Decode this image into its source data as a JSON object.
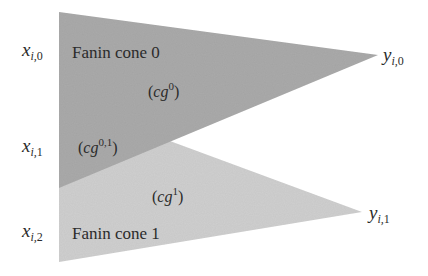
{
  "diagram": {
    "type": "fanin-cone-overlap",
    "colors": {
      "background": "#ffffff",
      "cone0_fill": "#ababab",
      "cone1_fill": "#d0d0d0",
      "text": "#2b2b2b"
    },
    "cones": [
      {
        "id": "cone0",
        "title": "Fanin cone 0",
        "region_label_base": "cg",
        "region_label_sup": "0",
        "polygon": [
          [
            59,
            12
          ],
          [
            378,
            55
          ],
          [
            59,
            188
          ]
        ]
      },
      {
        "id": "cone1",
        "title": "Fanin cone 1",
        "region_label_base": "cg",
        "region_label_sup": "1",
        "polygon": [
          [
            59,
            100
          ],
          [
            362,
            212
          ],
          [
            59,
            262
          ]
        ]
      }
    ],
    "overlap": {
      "region_label_base": "cg",
      "region_label_sup": "0,1"
    },
    "inputs": [
      {
        "base": "x",
        "sub_i": "i",
        "sub_n": "0"
      },
      {
        "base": "x",
        "sub_i": "i",
        "sub_n": "1"
      },
      {
        "base": "x",
        "sub_i": "i",
        "sub_n": "2"
      }
    ],
    "outputs": [
      {
        "base": "y",
        "sub_i": "i",
        "sub_n": "0"
      },
      {
        "base": "y",
        "sub_i": "i",
        "sub_n": "1"
      }
    ]
  }
}
